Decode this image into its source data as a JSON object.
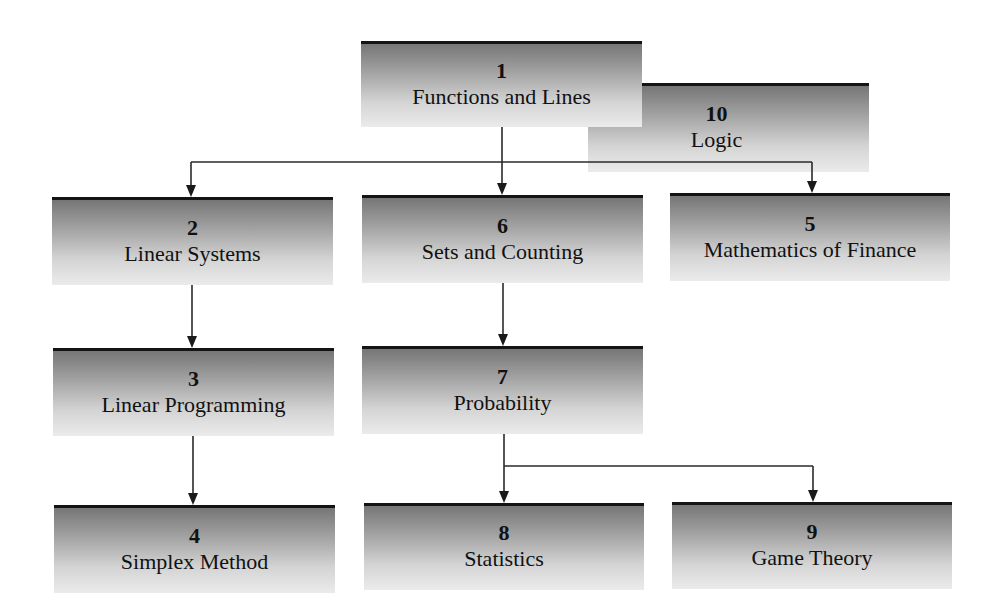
{
  "diagram": {
    "type": "chapter-dependency-flowchart",
    "boxes": [
      {
        "id": "b1",
        "number": "1",
        "title": "Functions and Lines"
      },
      {
        "id": "b10",
        "number": "10",
        "title": "Logic"
      },
      {
        "id": "b2",
        "number": "2",
        "title": "Linear Systems"
      },
      {
        "id": "b6",
        "number": "6",
        "title": "Sets and Counting"
      },
      {
        "id": "b5",
        "number": "5",
        "title": "Mathematics of Finance"
      },
      {
        "id": "b3",
        "number": "3",
        "title": "Linear Programming"
      },
      {
        "id": "b7",
        "number": "7",
        "title": "Probability"
      },
      {
        "id": "b4",
        "number": "4",
        "title": "Simplex Method"
      },
      {
        "id": "b8",
        "number": "8",
        "title": "Statistics"
      },
      {
        "id": "b9",
        "number": "9",
        "title": "Game Theory"
      }
    ],
    "edges": [
      {
        "from": "1",
        "to": "2"
      },
      {
        "from": "1",
        "to": "6"
      },
      {
        "from": "1",
        "to": "5"
      },
      {
        "from": "2",
        "to": "3"
      },
      {
        "from": "3",
        "to": "4"
      },
      {
        "from": "6",
        "to": "7"
      },
      {
        "from": "7",
        "to": "8"
      },
      {
        "from": "7",
        "to": "9"
      }
    ],
    "colors": {
      "box_top_border": "#141414",
      "gradient_top": "#767676",
      "gradient_bottom": "#ebebeb",
      "line": "#2a2a2a",
      "text": "#111111"
    }
  }
}
